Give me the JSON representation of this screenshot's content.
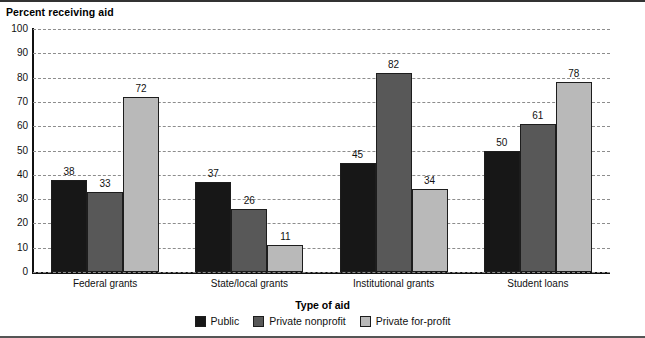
{
  "chart_data": {
    "type": "bar",
    "title": "Percent receiving aid",
    "xlabel": "Type of aid",
    "ylabel": "Percent receiving aid",
    "ylim": [
      0,
      100
    ],
    "ytick_step": 10,
    "yticks": [
      "100",
      "90",
      "80",
      "70",
      "60",
      "50",
      "40",
      "30",
      "20",
      "10",
      "0"
    ],
    "grid": "horizontal-dashed",
    "legend_position": "bottom-center",
    "legend_title": "Type of aid",
    "categories": [
      "Federal grants",
      "State/local grants",
      "Institutional grants",
      "Student loans"
    ],
    "series": [
      {
        "name": "Public",
        "color": "#171717",
        "values": [
          38,
          37,
          45,
          50
        ]
      },
      {
        "name": "Private nonprofit",
        "color": "#585858",
        "values": [
          33,
          26,
          82,
          61
        ]
      },
      {
        "name": "Private for-profit",
        "color": "#b9b9b9",
        "values": [
          72,
          11,
          34,
          78
        ]
      }
    ]
  }
}
